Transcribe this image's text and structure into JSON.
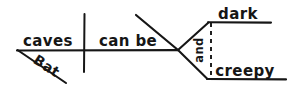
{
  "canvas": {
    "width": 294,
    "height": 94,
    "background_color": "#ffffff",
    "ink_color": "#161616"
  },
  "diagram": {
    "type": "hand-drawn-sentence-diagram",
    "subject": {
      "label": "caves",
      "x": 48,
      "y": 46
    },
    "modifier": {
      "label": "Bat",
      "x": 44,
      "y": 70,
      "rotation": 33
    },
    "predicate": {
      "label": "can be",
      "x": 128,
      "y": 46
    },
    "conjunction": {
      "label": "and",
      "x": 203,
      "y": 50,
      "rotation": -90
    },
    "complements": [
      {
        "label": "dark",
        "x": 238,
        "y": 19
      },
      {
        "label": "creepy",
        "x": 245,
        "y": 76
      }
    ]
  },
  "strokes": {
    "baseline": "M17,50.5 L178,50.2",
    "subject_predicate_divider": "M84.5,14 L84,72",
    "modifier_diagonal": "M17.5,50 L66,83",
    "long_upper_diagonal": "M136,15 L178,50",
    "fork_upper": "M178,50 L208.5,22.5",
    "fork_lower": "M178,50 L207.5,79",
    "dark_underline": "M208,22.2 L271,22.6",
    "creepy_underline": "M207,79 L286,79.4",
    "conjunction_dashes": "M211,23 L211,78"
  }
}
